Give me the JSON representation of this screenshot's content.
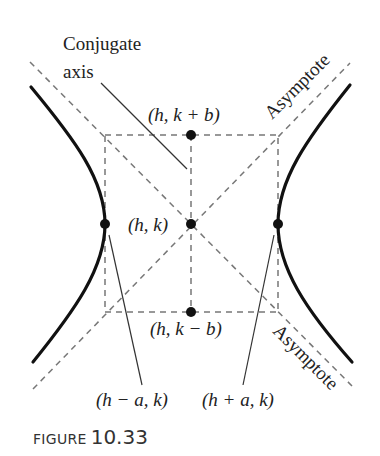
{
  "figure": {
    "caption_word": "FIGURE",
    "caption_number": "10.33"
  },
  "labels": {
    "conjugate_axis_line1": "Conjugate",
    "conjugate_axis_line2": "axis",
    "asymptote_upper": "Asymptote",
    "asymptote_lower": "Asymptote",
    "top_point": "(h, k + b)",
    "center_point": "(h, k)",
    "bottom_point": "(h, k − b)",
    "left_vertex": "(h − a, k)",
    "right_vertex": "(h + a, k)"
  },
  "geometry": {
    "center": [
      191,
      224
    ],
    "box": {
      "left": 105,
      "right": 278,
      "top": 135,
      "bottom": 312
    },
    "colors": {
      "curve": "#111111",
      "dashed": "#777777",
      "leader": "#333333",
      "point": "#111111"
    }
  }
}
